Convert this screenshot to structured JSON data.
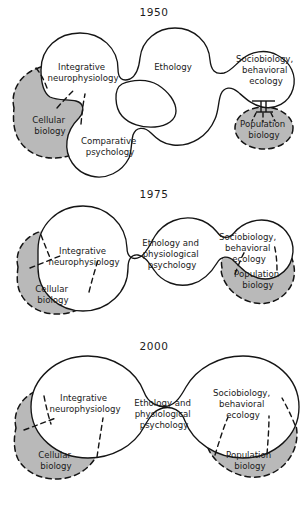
{
  "figure": {
    "colors": {
      "background": "#ffffff",
      "outline": "#151515",
      "grey_fill": "#b9b9b9",
      "text": "#1a1a1a"
    }
  },
  "panels": [
    {
      "id": "1950",
      "year": "1950",
      "white_lobes": [
        "Integrative neurophysiology",
        "Ethology",
        "Comparative psychology",
        "Sociobiology, behavioral ecology"
      ],
      "grey_blobs": [
        "Cellular biology",
        "Population biology"
      ],
      "labels": {
        "integrative": {
          "line1": "Integrative",
          "line2": "neurophysiology"
        },
        "ethology": {
          "line1": "Ethology"
        },
        "comparative": {
          "line1": "Comparative",
          "line2": "psychology"
        },
        "sociobiology": {
          "line1": "Sociobiology,",
          "line2": "behavioral",
          "line3": "ecology"
        },
        "cellular": {
          "line1": "Cellular",
          "line2": "biology"
        },
        "population": {
          "line1": "Population",
          "line2": "biology"
        }
      }
    },
    {
      "id": "1975",
      "year": "1975",
      "white_lobes": [
        "Integrative neurophysiology",
        "Ethology and physiological psychology",
        "Sociobiology, behavioral ecology"
      ],
      "grey_blobs": [
        "Cellular biology",
        "Population biology"
      ],
      "labels": {
        "integrative": {
          "line1": "Integrative",
          "line2": "neurophysiology"
        },
        "ethology": {
          "line1": "Ethology and",
          "line2": "physiological",
          "line3": "psychology"
        },
        "sociobiology": {
          "line1": "Sociobiology,",
          "line2": "behavioral",
          "line3": "ecology"
        },
        "cellular": {
          "line1": "Cellular",
          "line2": "biology"
        },
        "population": {
          "line1": "Population",
          "line2": "biology"
        }
      }
    },
    {
      "id": "2000",
      "year": "2000",
      "white_lobes": [
        "Integrative neurophysiology",
        "Ethology and physiological psychology",
        "Sociobiology, behavioral ecology"
      ],
      "grey_blobs": [
        "Cellular biology",
        "Population biology"
      ],
      "labels": {
        "integrative": {
          "line1": "Integrative",
          "line2": "neurophysiology"
        },
        "ethology": {
          "line1": "Ethology and",
          "line2": "physiological",
          "line3": "psychology"
        },
        "sociobiology": {
          "line1": "Sociobiology,",
          "line2": "behavioral",
          "line3": "ecology"
        },
        "cellular": {
          "line1": "Cellular",
          "line2": "biology"
        },
        "population": {
          "line1": "Population",
          "line2": "biology"
        }
      }
    }
  ]
}
